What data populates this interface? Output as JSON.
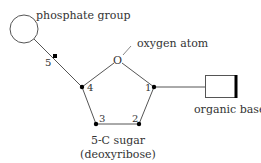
{
  "diagram": {
    "labels": {
      "phosphate": "phosphate group",
      "oxygen": "oxygen atom",
      "base": "organic base",
      "sugar_line1": "5-C sugar",
      "sugar_line2": "(deoxyribose)",
      "oxygen_symbol": "O"
    },
    "carbons": [
      {
        "id": "c1",
        "label": "1"
      },
      {
        "id": "c2",
        "label": "2"
      },
      {
        "id": "c3",
        "label": "3"
      },
      {
        "id": "c4",
        "label": "4"
      },
      {
        "id": "c5",
        "label": "5"
      }
    ],
    "colors": {
      "line": "#555555",
      "dot": "#000000",
      "text": "#333333"
    }
  }
}
